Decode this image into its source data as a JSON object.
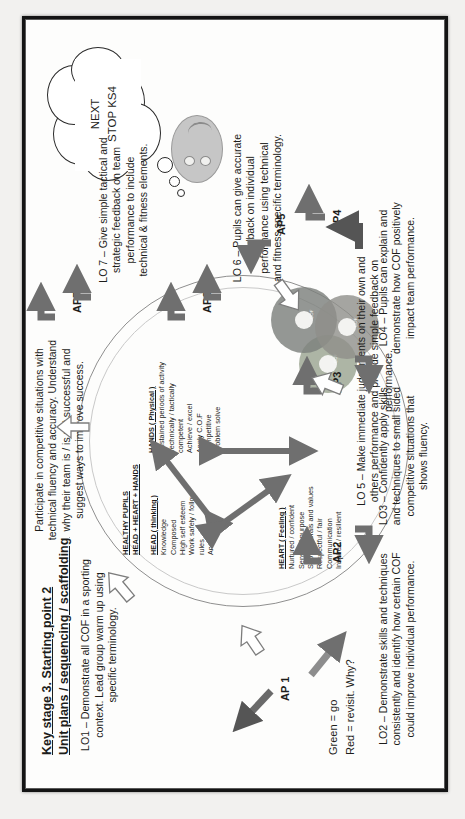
{
  "document": {
    "title_line1": "Key stage 3. Starting point 2",
    "title_line2": "Unit plans / sequencing / scaffolding",
    "key_line1": "Green = go",
    "key_line2": "Red = revisit. Why?"
  },
  "cloud": {
    "line1": "NEXT",
    "line2": "STOP KS4"
  },
  "learning_objectives": {
    "lo1": "LO1 – Demonstrate all COF in a sporting context. Lead group warm up using specific terminology.",
    "lo2": "LO2 – Demonstrate skills and techniques consistently and identify how certain COF could improve individual performance.",
    "lo3": "LO3 – Confidently apply skills and techniques to small sided competitive situations that shows fluency.",
    "lo4": "LO4 – Pupils can explain and demonstrate how COF positively impact team performance.",
    "lo5": "LO 5 – Make immediate judgements on their own and others performance and provide simple feedback on performance.",
    "lo6": "LO 6 – Pupils can give accurate feedback on individual performance using technical and fitness specific terminology.",
    "lo7": "LO 7 – Give simple tactical and strategic feedback on team performance to include technical & fitness elements.",
    "top_outcome": "Participate in competitive situations with technical fluency and accuracy. Understand why their team is / is not successful and suggest ways to improve success."
  },
  "assessment_points": {
    "ap1": "AP 1",
    "ap2": "AP2",
    "ap3": "AP3",
    "ap4": "AP4",
    "ap5": "AP5",
    "ap6": "AP6",
    "ap7": "AP7"
  },
  "triad": {
    "heading": "HEAD + HEART + HANDS",
    "subheading": "HEALTHY PUPILS",
    "head": {
      "label": "HEAD ( thinking )",
      "items": [
        "Knowledge",
        "Composed",
        "High self esteem",
        "Work safely / follow rules",
        "Analyse"
      ]
    },
    "heart": {
      "label": "HEART ( Feeling )",
      "items": [
        "Nurtured / confident",
        "Sense of purpose",
        "Strong morals and values",
        "Respectful / fair",
        "Communication",
        "Inspired / resilient"
      ]
    },
    "hands": {
      "label": "HANDS ( Physical )",
      "items": [
        "Sustained periods of activity",
        "Technically / tactically competent",
        "Achieve / excel",
        "Apply C.O.F",
        "Competitive",
        "Problem solve"
      ]
    }
  },
  "cd_graphic": {
    "disc1_label": "COF",
    "disc2_label": "COF",
    "disc3_label": "COF"
  },
  "colors": {
    "ink": "#1d1d1b",
    "arrow_grey": "#6f6f6f",
    "outline_grey": "#8f8f8f",
    "page": "#fdfdfc",
    "frame": "#141414"
  }
}
